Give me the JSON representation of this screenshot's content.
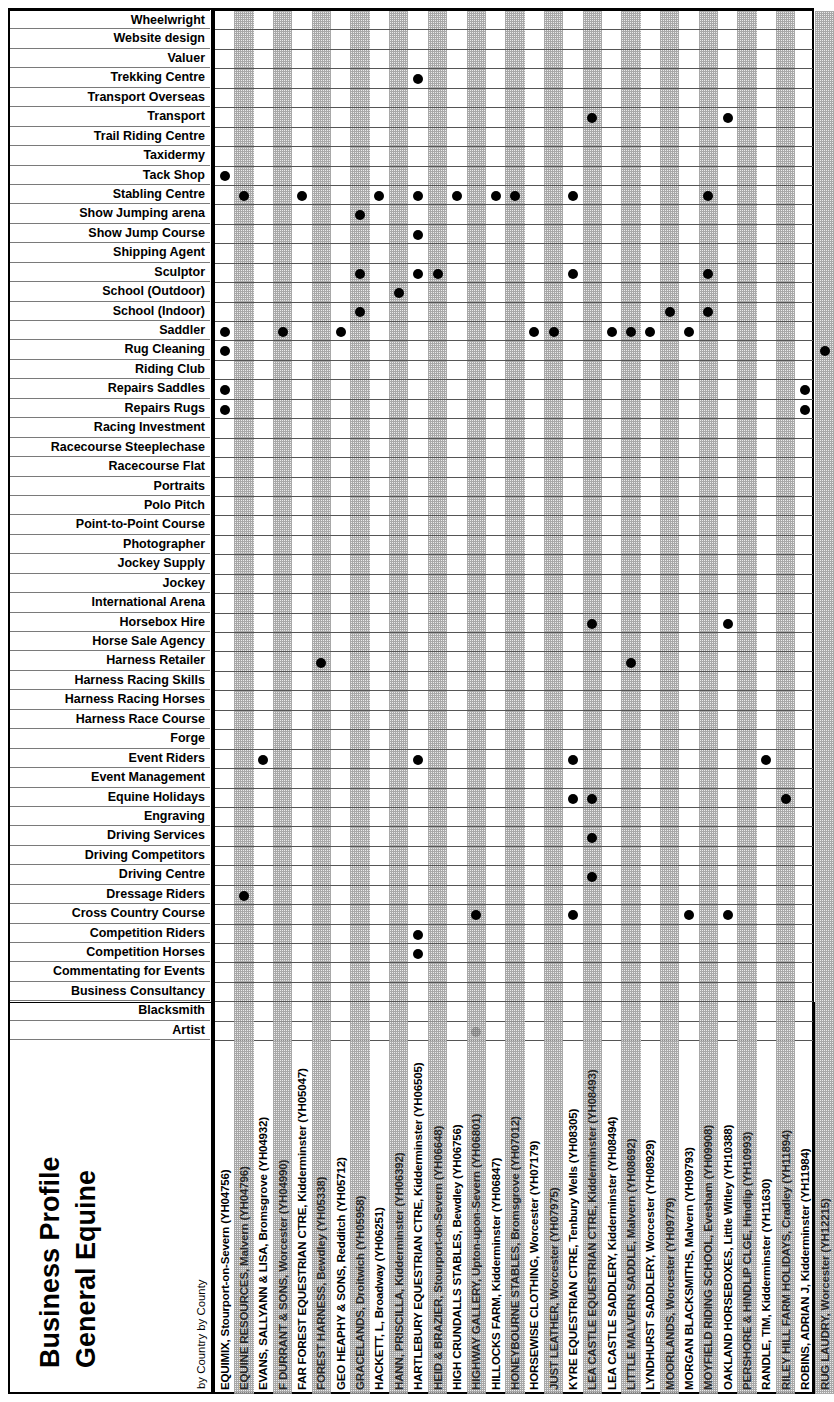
{
  "title": {
    "line1": "Business Profile",
    "line2": "General Equine",
    "subtitle": "by Country by County"
  },
  "chart_data": {
    "type": "heatmap",
    "title": "Business Profile General Equine",
    "subtitle": "by Country by County",
    "xlabel": "",
    "ylabel": "",
    "grid": true,
    "legend": "none",
    "marker": "filled-circle",
    "note": "Binary presence matrix: row = service category, column = business. Filled dot = business offers that service.",
    "rows": [
      "Wheelwright",
      "Website design",
      "Valuer",
      "Trekking Centre",
      "Transport Overseas",
      "Transport",
      "Trail Riding Centre",
      "Taxidermy",
      "Tack Shop",
      "Stabling Centre",
      "Show Jumping arena",
      "Show Jump Course",
      "Shipping Agent",
      "Sculptor",
      "School (Outdoor)",
      "School (Indoor)",
      "Saddler",
      "Rug Cleaning",
      "Riding Club",
      "Repairs Saddles",
      "Repairs Rugs",
      "Racing Investment",
      "Racecourse Steeplechase",
      "Racecourse Flat",
      "Portraits",
      "Polo Pitch",
      "Point-to-Point Course",
      "Photographer",
      "Jockey Supply",
      "Jockey",
      "International Arena",
      "Horsebox Hire",
      "Horse Sale Agency",
      "Harness Retailer",
      "Harness Racing Skills",
      "Harness Racing Horses",
      "Harness Race Course",
      "Forge",
      "Event Riders",
      "Event Management",
      "Equine Holidays",
      "Engraving",
      "Driving Services",
      "Driving Competitors",
      "Driving Centre",
      "Dressage Riders",
      "Cross Country Course",
      "Competition Riders",
      "Competition Horses",
      "Commentating for Events",
      "Business Consultancy",
      "Blacksmith",
      "Artist"
    ],
    "columns": [
      "EQUIMIX, Stourport-on-Severn (YH04756)",
      "EQUINE RESOURCES, Malvern (YH04796)",
      "EVANS, SALLYANN & LISA, Bromsgrove (YH04932)",
      "F DURRANT & SONS, Worcester (YH04990)",
      "FAR FOREST EQUESTRIAN CTRE, Kidderminster (YH05047)",
      "FOREST HARNESS, Bewdley (YH05338)",
      "GEO HEAPHY & SONS, Redditch (YH05712)",
      "GRACELANDS, Droitwich (YH05958)",
      "HACKETT, L, Broadway (YH06251)",
      "HANN, PRISCILLA, Kidderminster (YH06392)",
      "HARTLEBURY EQUESTRIAN CTRE, Kidderminster (YH06505)",
      "HEID & BRAZIER, Stourport-on-Severn (YH06648)",
      "HIGH CRUNDALLS STABLES, Bewdley (YH06756)",
      "HIGHWAY GALLERY, Upton-upon-Severn (YH06801)",
      "HILLOCKS FARM, Kidderminster (YH06847)",
      "HONEYBOURNE STABLES, Bromsgrove (YH07012)",
      "HORSEWISE CLOTHING, Worcester (YH07179)",
      "JUST LEATHER, Worcester (YH07975)",
      "KYRE EQUESTRIAN CTRE, Tenbury Wells (YH08305)",
      "LEA CASTLE EQUESTRIAN CTRE, Kidderminster (YH08493)",
      "LEA CASTLE SADDLERY, Kidderminster (YH08494)",
      "LITTLE MALVERN SADDLE, Malvern (YH08692)",
      "LYNDHURST SADDLERY, Worcester (YH08929)",
      "MOORLANDS, Worcester (YH09779)",
      "MORGAN BLACKSMITHS, Malvern (YH09793)",
      "MOYFIELD RIDING SCHOOL, Evesham (YH09908)",
      "OAKLAND HORSEBOXES, Little Witley (YH10388)",
      "PERSHORE & HINDLIP CLGE, Hindlip (YH10993)",
      "RANDLE, TIM, Kidderminster (YH11630)",
      "RILEY HILL FARM HOLIDAYS, Cradley (YH11894)",
      "ROBINS, ADRIAN J, Kidderminster (YH11984)",
      "RUG LAUDRY, Worcester (YH12215)"
    ],
    "cells": [
      {
        "row": "Trekking Centre",
        "col_index": 10
      },
      {
        "row": "Transport",
        "col_index": 19
      },
      {
        "row": "Transport",
        "col_index": 26
      },
      {
        "row": "Tack Shop",
        "col_index": 0
      },
      {
        "row": "Stabling Centre",
        "col_index": 1
      },
      {
        "row": "Stabling Centre",
        "col_index": 4
      },
      {
        "row": "Stabling Centre",
        "col_index": 8
      },
      {
        "row": "Stabling Centre",
        "col_index": 10
      },
      {
        "row": "Stabling Centre",
        "col_index": 12
      },
      {
        "row": "Stabling Centre",
        "col_index": 14
      },
      {
        "row": "Stabling Centre",
        "col_index": 15
      },
      {
        "row": "Stabling Centre",
        "col_index": 18
      },
      {
        "row": "Stabling Centre",
        "col_index": 25
      },
      {
        "row": "Show Jumping arena",
        "col_index": 7
      },
      {
        "row": "Show Jump Course",
        "col_index": 10
      },
      {
        "row": "Sculptor",
        "col_index": 7
      },
      {
        "row": "Sculptor",
        "col_index": 10
      },
      {
        "row": "Sculptor",
        "col_index": 11
      },
      {
        "row": "Sculptor",
        "col_index": 18
      },
      {
        "row": "Sculptor",
        "col_index": 25
      },
      {
        "row": "School (Outdoor)",
        "col_index": 9
      },
      {
        "row": "School (Indoor)",
        "col_index": 7
      },
      {
        "row": "School (Indoor)",
        "col_index": 23
      },
      {
        "row": "School (Indoor)",
        "col_index": 25
      },
      {
        "row": "Saddler",
        "col_index": 0
      },
      {
        "row": "Saddler",
        "col_index": 3
      },
      {
        "row": "Saddler",
        "col_index": 6
      },
      {
        "row": "Saddler",
        "col_index": 16
      },
      {
        "row": "Saddler",
        "col_index": 17
      },
      {
        "row": "Saddler",
        "col_index": 20
      },
      {
        "row": "Saddler",
        "col_index": 21
      },
      {
        "row": "Saddler",
        "col_index": 22
      },
      {
        "row": "Saddler",
        "col_index": 24
      },
      {
        "row": "Rug Cleaning",
        "col_index": 0
      },
      {
        "row": "Rug Cleaning",
        "col_index": 31
      },
      {
        "row": "Repairs Saddles",
        "col_index": 0
      },
      {
        "row": "Repairs Saddles",
        "col_index": 30
      },
      {
        "row": "Repairs Rugs",
        "col_index": 0
      },
      {
        "row": "Repairs Rugs",
        "col_index": 30
      },
      {
        "row": "Horsebox Hire",
        "col_index": 19
      },
      {
        "row": "Horsebox Hire",
        "col_index": 26
      },
      {
        "row": "Harness Retailer",
        "col_index": 5
      },
      {
        "row": "Harness Retailer",
        "col_index": 21
      },
      {
        "row": "Event Riders",
        "col_index": 2
      },
      {
        "row": "Event Riders",
        "col_index": 10
      },
      {
        "row": "Event Riders",
        "col_index": 18
      },
      {
        "row": "Event Riders",
        "col_index": 28
      },
      {
        "row": "Equine Holidays",
        "col_index": 18
      },
      {
        "row": "Equine Holidays",
        "col_index": 19
      },
      {
        "row": "Equine Holidays",
        "col_index": 29
      },
      {
        "row": "Driving Services",
        "col_index": 19
      },
      {
        "row": "Driving Centre",
        "col_index": 19
      },
      {
        "row": "Dressage Riders",
        "col_index": 1
      },
      {
        "row": "Cross Country Course",
        "col_index": 13
      },
      {
        "row": "Cross Country Course",
        "col_index": 18
      },
      {
        "row": "Cross Country Course",
        "col_index": 24
      },
      {
        "row": "Cross Country Course",
        "col_index": 26
      },
      {
        "row": "Competition Riders",
        "col_index": 10
      },
      {
        "row": "Competition Horses",
        "col_index": 10
      },
      {
        "row": "Artist",
        "col_index": 13
      }
    ]
  }
}
